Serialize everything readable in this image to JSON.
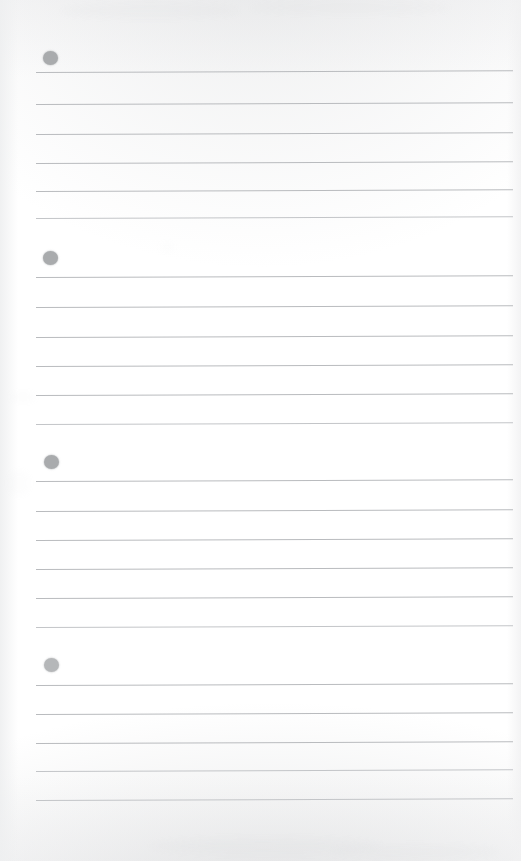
{
  "document": {
    "kind": "scanned-lined-note-page",
    "page_width": 521,
    "page_height": 861,
    "background_color": "#ffffff",
    "rule_line_color": "#b9bbbe",
    "bullet_color": "#a9abad",
    "bullet_count": 4,
    "total_rule_lines": 23,
    "note_text": "",
    "title": ""
  },
  "layout": {
    "rule_left_x": 36,
    "rule_right_x": 513,
    "bullet_left_x": 43,
    "bullet_diameter": 15,
    "line_skew_deg": -0.22
  },
  "groups": [
    {
      "index": 1,
      "label": "bullet-group-1",
      "bullet": {
        "x": 43,
        "y": 51,
        "opacity": 1.0
      },
      "lines": [
        {
          "y": 72,
          "weight": "normal"
        },
        {
          "y": 104,
          "weight": "normal"
        },
        {
          "y": 134,
          "weight": "normal"
        },
        {
          "y": 163,
          "weight": "normal"
        },
        {
          "y": 191,
          "weight": "normal"
        },
        {
          "y": 218,
          "weight": "soft"
        }
      ]
    },
    {
      "index": 2,
      "label": "bullet-group-2",
      "bullet": {
        "x": 43,
        "y": 251,
        "opacity": 1.0
      },
      "lines": [
        {
          "y": 277,
          "weight": "normal"
        },
        {
          "y": 307,
          "weight": "normal"
        },
        {
          "y": 337,
          "weight": "normal"
        },
        {
          "y": 366,
          "weight": "normal"
        },
        {
          "y": 395,
          "weight": "normal"
        },
        {
          "y": 424,
          "weight": "soft"
        }
      ]
    },
    {
      "index": 3,
      "label": "bullet-group-3",
      "bullet": {
        "x": 44,
        "y": 455,
        "opacity": 1.0
      },
      "lines": [
        {
          "y": 481,
          "weight": "normal"
        },
        {
          "y": 511,
          "weight": "normal"
        },
        {
          "y": 540,
          "weight": "normal"
        },
        {
          "y": 569,
          "weight": "normal"
        },
        {
          "y": 598,
          "weight": "normal"
        },
        {
          "y": 627,
          "weight": "soft"
        }
      ]
    },
    {
      "index": 4,
      "label": "bullet-group-4",
      "bullet": {
        "x": 44,
        "y": 658,
        "opacity": 0.85
      },
      "lines": [
        {
          "y": 685,
          "weight": "normal"
        },
        {
          "y": 714,
          "weight": "normal"
        },
        {
          "y": 743,
          "weight": "normal"
        },
        {
          "y": 771,
          "weight": "soft"
        },
        {
          "y": 800,
          "weight": "soft"
        }
      ]
    }
  ],
  "artifacts": {
    "smudges": [
      {
        "x": 60,
        "y": 4,
        "w": 180,
        "h": 14,
        "opacity": 0.3
      },
      {
        "x": 250,
        "y": 2,
        "w": 200,
        "h": 12,
        "opacity": 0.26
      },
      {
        "x": 150,
        "y": 838,
        "w": 230,
        "h": 16,
        "opacity": 0.34
      },
      {
        "x": 330,
        "y": 845,
        "w": 170,
        "h": 13,
        "opacity": 0.28
      },
      {
        "x": 10,
        "y": 392,
        "w": 26,
        "h": 10,
        "opacity": 0.22
      },
      {
        "x": 8,
        "y": 470,
        "w": 22,
        "h": 26,
        "opacity": 0.18
      },
      {
        "x": 160,
        "y": 243,
        "w": 14,
        "h": 8,
        "opacity": 0.22
      }
    ]
  }
}
